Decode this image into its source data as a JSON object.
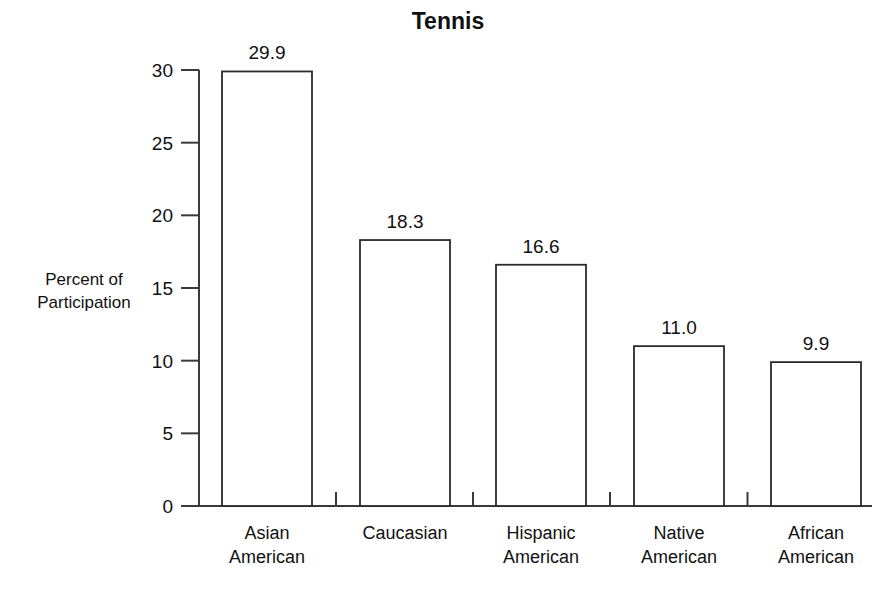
{
  "chart_data": {
    "type": "bar",
    "title": "Tennis",
    "xlabel": "",
    "ylabel": "Percent of\nParticipation",
    "categories": [
      "Asian\nAmerican",
      "Caucasian",
      "Hispanic\nAmerican",
      "Native\nAmerican",
      "African\nAmerican"
    ],
    "category_lines": [
      [
        "Asian",
        "American"
      ],
      [
        "Caucasian"
      ],
      [
        "Hispanic",
        "American"
      ],
      [
        "Native",
        "American"
      ],
      [
        "African",
        "American"
      ]
    ],
    "values": [
      29.9,
      18.3,
      16.6,
      11.0,
      9.9
    ],
    "value_labels": [
      "29.9",
      "18.3",
      "16.6",
      "11.0",
      "9.9"
    ],
    "ylim": [
      0,
      30
    ],
    "ytick_values": [
      0,
      5,
      10,
      15,
      20,
      25,
      30
    ],
    "ytick_labels": [
      "0",
      "5",
      "10",
      "15",
      "20",
      "25",
      "30"
    ],
    "grid": false,
    "legend": "none",
    "bar_fill_color": "#ffffff",
    "bar_stroke_color": "#2b2b2b",
    "axis_color": "#3a3a3a",
    "text_color": "#111111",
    "background_color": "#ffffff"
  }
}
